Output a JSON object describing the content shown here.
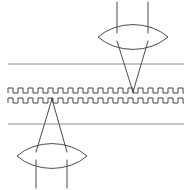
{
  "figure": {
    "title": "",
    "width": 192,
    "height": 190,
    "background_color": "#ffffff"
  },
  "colors": {
    "ray_stroke": "#4a4a52",
    "lens_stroke": "#4a4a52",
    "grating_stroke": "#44444c",
    "axis_line_stroke": "#8c8c94"
  },
  "chart_data": {
    "type": "line",
    "title": "",
    "xlabel": "",
    "ylabel": "",
    "grid": false,
    "legend_position": "none",
    "xlim": [
      0,
      192
    ],
    "ylim": [
      0,
      190
    ],
    "series": [
      {
        "name": "upper-incoming-ray-left",
        "kind": "polyline",
        "stroke": "#4a4a52",
        "stroke_width": 1,
        "points": [
          [
            117,
            2
          ],
          [
            117,
            33
          ]
        ]
      },
      {
        "name": "upper-incoming-ray-right",
        "kind": "polyline",
        "stroke": "#4a4a52",
        "stroke_width": 1,
        "points": [
          [
            148,
            2
          ],
          [
            148,
            33
          ]
        ]
      },
      {
        "name": "upper-converging-ray-left",
        "kind": "polyline",
        "stroke": "#4a4a52",
        "stroke_width": 1,
        "points": [
          [
            117,
            41
          ],
          [
            133,
            92
          ]
        ]
      },
      {
        "name": "upper-converging-ray-right",
        "kind": "polyline",
        "stroke": "#4a4a52",
        "stroke_width": 1,
        "points": [
          [
            148,
            41
          ],
          [
            133,
            92
          ]
        ]
      },
      {
        "name": "lower-diverging-ray-left",
        "kind": "polyline",
        "stroke": "#4a4a52",
        "stroke_width": 1,
        "points": [
          [
            52,
            99
          ],
          [
            36,
            152
          ]
        ]
      },
      {
        "name": "lower-diverging-ray-right",
        "kind": "polyline",
        "stroke": "#4a4a52",
        "stroke_width": 1,
        "points": [
          [
            52,
            99
          ],
          [
            67,
            152
          ]
        ]
      },
      {
        "name": "lower-outgoing-ray-left",
        "kind": "polyline",
        "stroke": "#4a4a52",
        "stroke_width": 1,
        "points": [
          [
            36,
            160
          ],
          [
            36,
            188
          ]
        ]
      },
      {
        "name": "lower-outgoing-ray-right",
        "kind": "polyline",
        "stroke": "#4a4a52",
        "stroke_width": 1,
        "points": [
          [
            67,
            160
          ],
          [
            67,
            188
          ]
        ]
      }
    ],
    "lenses": [
      {
        "name": "upper-lens",
        "center_x": 133,
        "center_y": 37,
        "half_width": 35,
        "half_height": 9,
        "shape": "biconvex"
      },
      {
        "name": "lower-lens",
        "center_x": 52,
        "center_y": 156,
        "half_width": 35,
        "half_height": 9,
        "shape": "biconvex"
      }
    ],
    "reference_lines": [
      {
        "name": "upper-reference-line",
        "y": 64,
        "x_start": 8,
        "x_end": 184,
        "stroke": "#8c8c94"
      },
      {
        "name": "lower-reference-line",
        "y": 124,
        "x_start": 8,
        "x_end": 184,
        "stroke": "#8c8c94"
      }
    ],
    "gratings": [
      {
        "name": "upper-grating",
        "baseline_y": 93,
        "amplitude": 5,
        "period": 10,
        "duty_cycle": 0.5,
        "x_start": 8,
        "x_end": 184,
        "stroke": "#44444c"
      },
      {
        "name": "lower-grating",
        "baseline_y": 103,
        "amplitude": 5,
        "period": 10,
        "duty_cycle": 0.5,
        "x_start": 8,
        "x_end": 184,
        "stroke": "#44444c"
      }
    ],
    "focal_points": [
      {
        "name": "upper-focal-point",
        "x": 133,
        "y": 92
      },
      {
        "name": "lower-source-point",
        "x": 52,
        "y": 99
      }
    ]
  }
}
